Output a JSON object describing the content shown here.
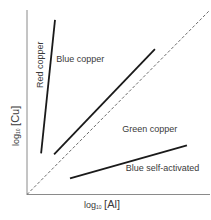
{
  "chart_data": {
    "type": "line",
    "title": "",
    "xlabel": "log10 [Al]",
    "ylabel": "log10 [Cu]",
    "xlabel_parts": {
      "pre": "log",
      "sub": "10",
      "arg": "[Al]"
    },
    "ylabel_parts": {
      "pre": "log",
      "sub": "10",
      "arg": "[Cu]"
    },
    "xlim": [
      0,
      100
    ],
    "ylim": [
      0,
      100
    ],
    "ticks": "none",
    "grid": false,
    "legend": "none",
    "note": "Schematic phase-boundary diagram; no numeric tick labels. Coordinates normalized to 0-100 plot units.",
    "series": [
      {
        "name": "Red copper / Blue copper boundary",
        "style": "solid",
        "x": [
          7.7,
          15.3
        ],
        "y": [
          22.3,
          94.6
        ]
      },
      {
        "name": "Blue copper / Green copper boundary",
        "style": "solid",
        "x": [
          14.8,
          69.9
        ],
        "y": [
          21.7,
          78.8
        ]
      },
      {
        "name": "Green copper / Blue self-activated boundary",
        "style": "solid",
        "x": [
          23.5,
          87.4
        ],
        "y": [
          8.7,
          26.6
        ]
      },
      {
        "name": "Equal concentration reference",
        "style": "dashed",
        "x": [
          0,
          100
        ],
        "y": [
          0,
          100
        ]
      }
    ],
    "annotations": [
      {
        "text": "Red copper",
        "x": 5,
        "y": 55,
        "rotation": 90
      },
      {
        "text": "Blue copper",
        "x": 16,
        "y": 73
      },
      {
        "text": "Green copper",
        "x": 52,
        "y": 35
      },
      {
        "text": "Blue self-activated",
        "x": 54,
        "y": 14
      }
    ]
  }
}
